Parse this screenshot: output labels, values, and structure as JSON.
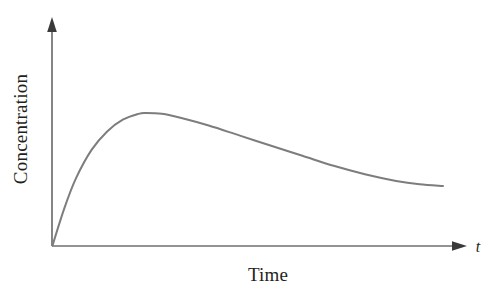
{
  "chart_data": {
    "type": "line",
    "title": "",
    "subtitle": "",
    "xlabel": "Time",
    "ylabel": "Concentration",
    "x_axis_symbol": "t",
    "grid": false,
    "legend": null,
    "axes_style": "arrow-headed half-axes, no tick marks, no tick labels",
    "xlim": [
      0,
      1
    ],
    "ylim": [
      0,
      1
    ],
    "series": [
      {
        "name": "Concentration",
        "color": "#7d7d7d",
        "line_width": 2.0,
        "x": [
          0.0,
          0.03,
          0.06,
          0.1,
          0.14,
          0.18,
          0.22,
          0.24,
          0.28,
          0.33,
          0.4,
          0.48,
          0.56,
          0.64,
          0.72,
          0.8,
          0.88,
          0.94,
          1.0
        ],
        "y": [
          0.0,
          0.22,
          0.4,
          0.57,
          0.68,
          0.75,
          0.785,
          0.79,
          0.785,
          0.76,
          0.715,
          0.655,
          0.595,
          0.535,
          0.475,
          0.425,
          0.385,
          0.365,
          0.355
        ],
        "peak": {
          "x": 0.24,
          "y": 0.79
        }
      }
    ]
  },
  "figure": {
    "background_color": "#ffffff",
    "axis_color": "#6f6f6f",
    "text_color": "#231f20",
    "curve_color": "#7d7d7d"
  }
}
